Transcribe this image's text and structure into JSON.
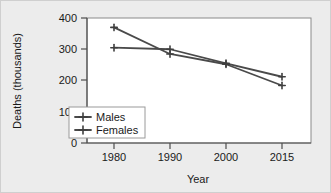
{
  "chart_data": {
    "type": "line",
    "title": "",
    "xlabel": "Year",
    "ylabel": "Deaths (thousands)",
    "categories": [
      "1980",
      "1990",
      "2000",
      "2015"
    ],
    "x": [
      1980,
      1990,
      2000,
      2015
    ],
    "xtick_labels": [
      "1980",
      "1990",
      "2000",
      "2015"
    ],
    "ytick_labels": [
      "0",
      "100",
      "200",
      "300",
      "400"
    ],
    "ytick_values": [
      0,
      100,
      200,
      300,
      400
    ],
    "ylim": [
      0,
      400
    ],
    "grid": false,
    "legend_position": "inside-lower-left",
    "series": [
      {
        "name": "Males",
        "values": [
          305,
          300,
          255,
          212
        ],
        "color": "#4a4a4a",
        "marker": "plus"
      },
      {
        "name": "Females",
        "values": [
          370,
          285,
          252,
          184
        ],
        "color": "#4a4a4a",
        "marker": "plus"
      }
    ]
  },
  "axes": {
    "y_title": "Deaths (thousands)",
    "x_title": "Year",
    "y_ticks": [
      {
        "label": "400",
        "value": 400
      },
      {
        "label": "300",
        "value": 300
      },
      {
        "label": "200",
        "value": 200
      },
      {
        "label": "100",
        "value": 100
      },
      {
        "label": "0",
        "value": 0
      }
    ],
    "x_ticks": [
      {
        "label": "1980",
        "value": 1980
      },
      {
        "label": "1990",
        "value": 1990
      },
      {
        "label": "2000",
        "value": 2000
      },
      {
        "label": "2015",
        "value": 2015
      }
    ]
  },
  "legend": {
    "entries": [
      {
        "label": "Males"
      },
      {
        "label": "Females"
      }
    ]
  },
  "colors": {
    "background": "#ececec",
    "plot_background": "#ffffff",
    "line": "#4a4a4a",
    "axis": "#4d4d4d",
    "text": "#1a1a1a"
  }
}
